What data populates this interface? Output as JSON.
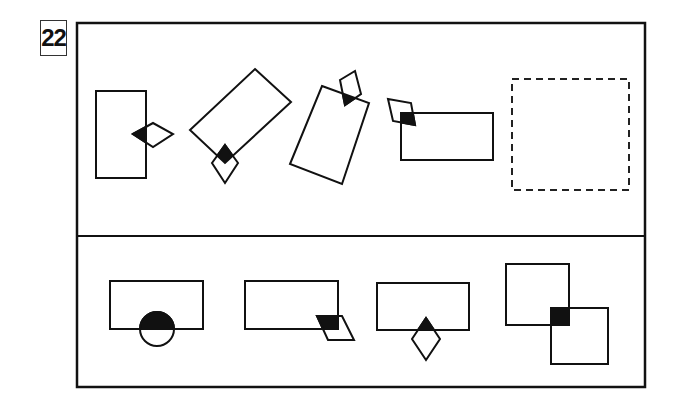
{
  "puzzle": {
    "number": "22",
    "question_panel": {
      "figures": [
        {
          "id": "q1",
          "description": "upright rectangle with diamond overlapping right edge; overlap filled black"
        },
        {
          "id": "q2",
          "description": "rotated rectangle with diamond overlapping lower corner; overlap filled black"
        },
        {
          "id": "q3",
          "description": "tilted rectangle with kite overlapping top edge; overlap filled black"
        },
        {
          "id": "q4",
          "description": "horizontal rectangle with kite overlapping top-left corner; overlap filled black"
        },
        {
          "id": "q5",
          "description": "dashed empty answer box"
        }
      ]
    },
    "answer_panel": {
      "options": [
        {
          "id": "A",
          "description": "rectangle with circle overlapping bottom edge; top half of circle filled black"
        },
        {
          "id": "B",
          "description": "rectangle with parallelogram overlapping bottom-right corner; overlap filled black"
        },
        {
          "id": "C",
          "description": "rectangle with diamond overlapping bottom edge; overlap filled black"
        },
        {
          "id": "D",
          "description": "two overlapping squares; overlap filled black"
        }
      ]
    },
    "colors": {
      "stroke": "#111111",
      "fill": "#111111",
      "background": "#ffffff"
    }
  }
}
